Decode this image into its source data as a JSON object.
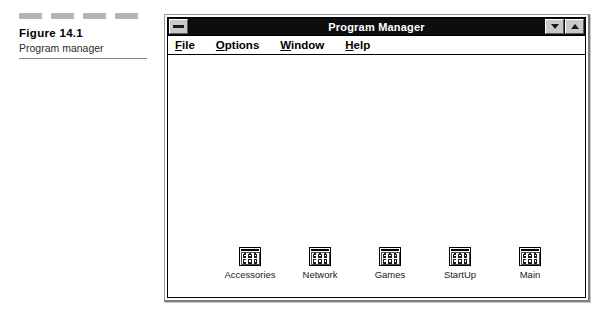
{
  "figure": {
    "number": "Figure 14.1",
    "title": "Program manager",
    "dash_count": 4,
    "dash_color": "#b4b4b4"
  },
  "window": {
    "title": "Program Manager",
    "titlebar_color": "#0d0d0d",
    "titlebar_text_color": "#ffffff",
    "client_color": "#ffffff",
    "control_box_icon": "minimize-bar-icon",
    "buttons": [
      {
        "name": "minimize-button",
        "icon": "triangle-down-icon"
      },
      {
        "name": "maximize-button",
        "icon": "triangle-up-icon"
      }
    ]
  },
  "menu": {
    "items": [
      {
        "label": "File",
        "mnemonic": "F"
      },
      {
        "label": "Options",
        "mnemonic": "O"
      },
      {
        "label": "Window",
        "mnemonic": "W"
      },
      {
        "label": "Help",
        "mnemonic": "H"
      }
    ]
  },
  "groups": [
    {
      "label": "Accessories",
      "icon": "program-group-icon"
    },
    {
      "label": "Network",
      "icon": "program-group-icon"
    },
    {
      "label": "Games",
      "icon": "program-group-icon"
    },
    {
      "label": "StartUp",
      "icon": "program-group-icon"
    },
    {
      "label": "Main",
      "icon": "program-group-icon"
    }
  ]
}
